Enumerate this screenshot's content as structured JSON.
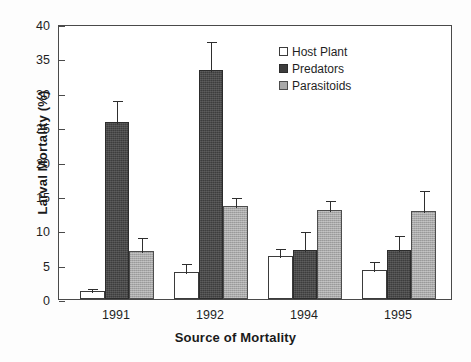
{
  "chart_data": {
    "type": "bar",
    "title": "",
    "xlabel": "Source of Mortality",
    "ylabel": "Larval Mortality (%)",
    "categories": [
      "1991",
      "1992",
      "1994",
      "1995"
    ],
    "ylim": [
      0,
      40
    ],
    "yticks": [
      0,
      5,
      10,
      15,
      20,
      25,
      30,
      35,
      40
    ],
    "ytick_labels": [
      "0",
      "5",
      "10",
      "15",
      "20",
      "25",
      "30",
      "35",
      "40"
    ],
    "grid": false,
    "legend_position": "upper right",
    "series": [
      {
        "name": "Host Plant",
        "color": "#ffffff",
        "values": [
          1.2,
          3.9,
          6.3,
          4.2
        ],
        "errors": [
          0.6,
          1.5,
          1.3,
          1.5
        ]
      },
      {
        "name": "Predators",
        "color": "#3d3d3d",
        "values": [
          25.8,
          33.3,
          7.1,
          7.1
        ],
        "errors": [
          3.3,
          4.4,
          2.9,
          2.3
        ]
      },
      {
        "name": "Parasitoids",
        "color": "#a9a9a9",
        "values": [
          7.0,
          13.5,
          13.0,
          12.8
        ],
        "errors": [
          2.1,
          1.5,
          1.6,
          3.2
        ]
      }
    ]
  },
  "legend": {
    "items": [
      {
        "label": "Host Plant"
      },
      {
        "label": "Predators"
      },
      {
        "label": "Parasitoids"
      }
    ]
  }
}
